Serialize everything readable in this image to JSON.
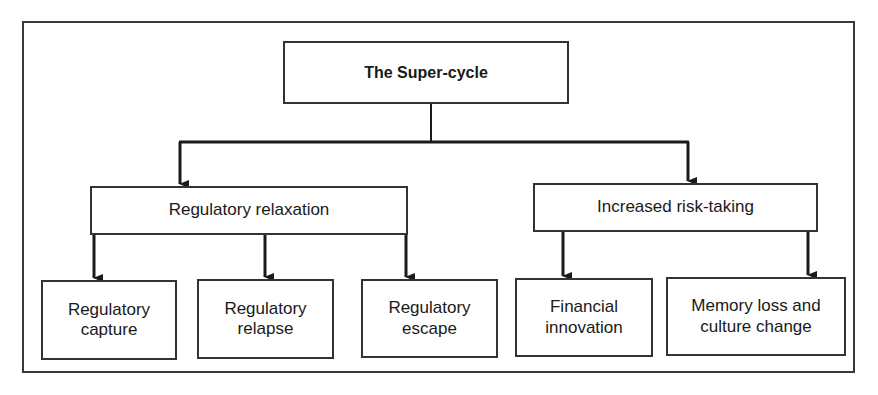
{
  "diagram": {
    "root": {
      "label": "The Super-cycle"
    },
    "branches": [
      {
        "label": "Regulatory relaxation",
        "children": [
          {
            "line1": "Regulatory",
            "line2": "capture"
          },
          {
            "line1": "Regulatory",
            "line2": "relapse"
          },
          {
            "line1": "Regulatory",
            "line2": "escape"
          }
        ]
      },
      {
        "label": "Increased risk-taking",
        "children": [
          {
            "line1": "Financial",
            "line2": "innovation"
          },
          {
            "line1": "Memory loss and",
            "line2": "culture change"
          }
        ]
      }
    ],
    "colors": {
      "line": "#1a1a1a",
      "border": "#333333",
      "background": "#ffffff"
    }
  }
}
